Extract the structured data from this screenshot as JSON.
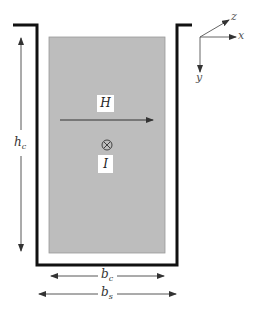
{
  "diagram": {
    "type": "slot-conductor cross-section",
    "colors": {
      "conductor_fill": "#bdbdbd",
      "slot_wall": "#111111",
      "arrow": "#333333",
      "label_box": "#ffffff"
    },
    "labels": {
      "field": "H",
      "current": "I",
      "current_direction_symbol": "⊗",
      "conductor_height": "h",
      "conductor_height_sub": "c",
      "conductor_width": "b",
      "conductor_width_sub": "c",
      "slot_width": "b",
      "slot_width_sub": "s"
    },
    "axes": {
      "x": "x",
      "y": "y",
      "z": "z"
    }
  }
}
